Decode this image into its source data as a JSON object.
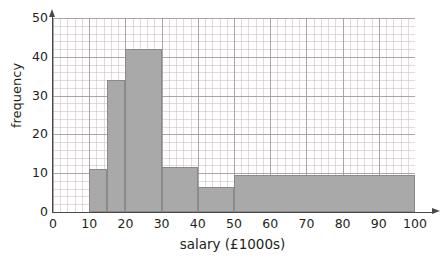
{
  "chart_data": {
    "type": "bar",
    "title": "",
    "xlabel": "salary (£1000s)",
    "ylabel": "frequency",
    "xlim": [
      0,
      100
    ],
    "ylim": [
      0,
      50
    ],
    "grid": true,
    "legend": null,
    "x_ticks": [
      "0",
      "10",
      "20",
      "30",
      "40",
      "50",
      "60",
      "70",
      "80",
      "90",
      "100"
    ],
    "x_tick_values": [
      0,
      10,
      20,
      30,
      40,
      50,
      60,
      70,
      80,
      90,
      100
    ],
    "y_ticks": [
      "0",
      "10",
      "20",
      "30",
      "40",
      "50"
    ],
    "y_tick_values": [
      0,
      10,
      20,
      30,
      40,
      50
    ],
    "bin_edges": [
      10,
      15,
      20,
      30,
      40,
      50,
      100
    ],
    "categories": [
      "10-15",
      "15-20",
      "20-30",
      "30-40",
      "40-50",
      "50-100"
    ],
    "values": [
      11,
      34,
      42,
      11.5,
      6.5,
      9.5
    ],
    "bars": [
      {
        "label": "10-15",
        "start": 10,
        "end": 15,
        "value": 11
      },
      {
        "label": "15-20",
        "start": 15,
        "end": 20,
        "value": 34
      },
      {
        "label": "20-30",
        "start": 20,
        "end": 30,
        "value": 42
      },
      {
        "label": "30-40",
        "start": 30,
        "end": 40,
        "value": 11.5
      },
      {
        "label": "40-50",
        "start": 40,
        "end": 50,
        "value": 6.5
      },
      {
        "label": "50-100",
        "start": 50,
        "end": 100,
        "value": 9.5
      }
    ],
    "colors": {
      "bar_fill": "#a9a9a9",
      "bar_border": "#8a8a8a",
      "axis": "#4a4a4a",
      "grid_major": "#96969b",
      "grid_minor": "#cdb9be",
      "text": "#231f20",
      "background": "#ffffff"
    }
  }
}
